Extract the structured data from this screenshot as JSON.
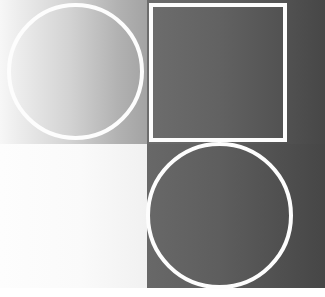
{
  "artwork": {
    "title": "Abstract Gradient Quadrant Composition",
    "canvas": {
      "width_px": 325,
      "height_px": 297,
      "background_color": "#ffffff"
    },
    "outline_color": "#fdfdfd",
    "outline_width_px": 4,
    "split_x_px": 147,
    "split_y_px": 144,
    "content_bottom_px": 288
  },
  "panels": [
    {
      "name": "top-left",
      "x": 0,
      "y": 0,
      "width": 147,
      "height": 144,
      "gradient_direction": "left-to-right",
      "gradient_from": "#f7f7f7",
      "gradient_to": "#a3a3a3",
      "tone": "light"
    },
    {
      "name": "top-right",
      "x": 147,
      "y": 0,
      "width": 178,
      "height": 144,
      "gradient_direction": "left-to-right",
      "gradient_from": "#6d6d6d",
      "gradient_to": "#474747",
      "tone": "dark"
    },
    {
      "name": "bottom-left",
      "x": 0,
      "y": 144,
      "width": 147,
      "height": 144,
      "gradient_direction": "left-to-right",
      "gradient_from": "#fdfdfd",
      "gradient_to": "#f1f1f1",
      "tone": "near-white"
    },
    {
      "name": "bottom-right",
      "x": 147,
      "y": 144,
      "width": 178,
      "height": 144,
      "gradient_direction": "left-to-right",
      "gradient_from": "#686868",
      "gradient_to": "#464646",
      "tone": "dark"
    }
  ],
  "shapes": [
    {
      "name": "circle-top-left",
      "type": "circle",
      "x": 7,
      "y": 3,
      "width": 137,
      "height": 137,
      "stroke_color": "#fdfdfd",
      "stroke_width": 4,
      "fill": "none",
      "on_panel": "top-left"
    },
    {
      "name": "rect-top-right",
      "type": "rectangle",
      "x": 149,
      "y": 3,
      "width": 138,
      "height": 139,
      "stroke_color": "#fdfdfd",
      "stroke_width": 4,
      "fill": "none",
      "on_panel": "top-right"
    },
    {
      "name": "circle-bottom-right",
      "type": "circle",
      "x": 146,
      "y": 142,
      "width": 147,
      "height": 147,
      "stroke_color": "#fdfdfd",
      "stroke_width": 4,
      "fill": "none",
      "on_panel": "bottom-right"
    }
  ]
}
